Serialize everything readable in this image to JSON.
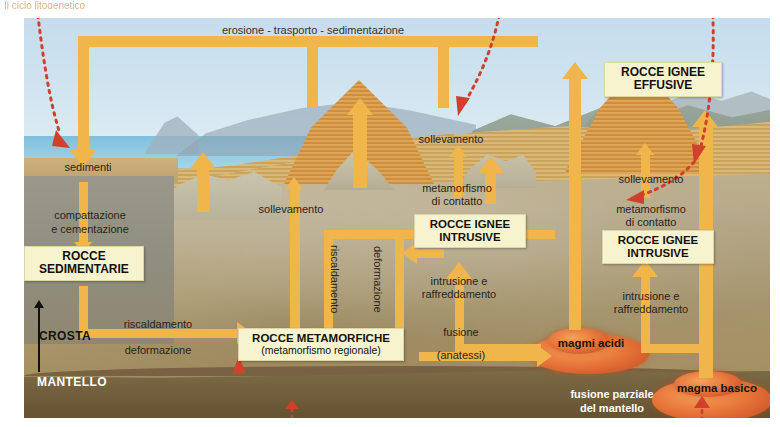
{
  "figure": {
    "title_cut": "Il ciclo litogenetico",
    "domain": "geology-rock-cycle-diagram",
    "language": "it"
  },
  "colors": {
    "arrow": "#f0b54b",
    "box_fill": "#f7f3cf",
    "magma": "#e8763a",
    "red_dotted": "#d1402c",
    "crust": "#b7a579",
    "mantle": "#6e5c3a",
    "sky": "#cfe3ef",
    "sea": "#9ccfe4"
  },
  "boxes": [
    {
      "id": "rocce-sedimentarie",
      "line1": "ROCCE",
      "line2": "SEDIMENTARIE",
      "sub": ""
    },
    {
      "id": "rocce-ignee-intrusive-center",
      "line1": "ROCCE IGNEE",
      "line2": "INTRUSIVE",
      "sub": ""
    },
    {
      "id": "rocce-ignee-intrusive-right",
      "line1": "ROCCE IGNEE",
      "line2": "INTRUSIVE",
      "sub": ""
    },
    {
      "id": "rocce-ignee-effusive",
      "line1": "ROCCE IGNEE",
      "line2": "EFFUSIVE",
      "sub": ""
    },
    {
      "id": "rocce-metamorfiche",
      "line1": "ROCCE METAMORFICHE",
      "line2": "",
      "sub": "(metamorfismo regionale)"
    }
  ],
  "labels": {
    "erosione": "erosione - trasporto - sedimentazione",
    "sedimenti": "sedimenti",
    "compattazione_l1": "compattazione",
    "compattazione_l2": "e cementazione",
    "riscaldamento_h": "riscaldamento",
    "deformazione_h": "deformazione",
    "sollevamento_left": "sollevamento",
    "riscaldamento_v": "riscaldamento",
    "deformazione_v": "deformazione",
    "sollevamento_center": "sollevamento",
    "metamorfismo_center_l1": "metamorfismo",
    "metamorfismo_center_l2": "di contatto",
    "intrusione_center_l1": "intrusione e",
    "intrusione_center_l2": "raffreddamento",
    "sollevamento_right": "sollevamento",
    "metamorfismo_right_l1": "metamorfismo",
    "metamorfismo_right_l2": "di contatto",
    "intrusione_right_l1": "intrusione e",
    "intrusione_right_l2": "raffreddamento",
    "fusione_l1": "fusione",
    "fusione_l2": "(anatessi)",
    "magmi_acidi": "magmi acidi",
    "magma_basico": "magma basico",
    "fusione_parziale_l1": "fusione parziale",
    "fusione_parziale_l2": "del mantello",
    "crosta": "CROSTA",
    "mantello": "MANTELLO"
  }
}
